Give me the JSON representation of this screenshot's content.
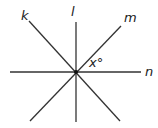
{
  "diagram": {
    "lines": [
      {
        "name": "k",
        "label": "k"
      },
      {
        "name": "l",
        "label": "l"
      },
      {
        "name": "m",
        "label": "m"
      },
      {
        "name": "n",
        "label": "n"
      }
    ],
    "angle_label": "x°",
    "colors": {
      "line": "#333333",
      "text": "#222222",
      "background": "#ffffff"
    }
  }
}
